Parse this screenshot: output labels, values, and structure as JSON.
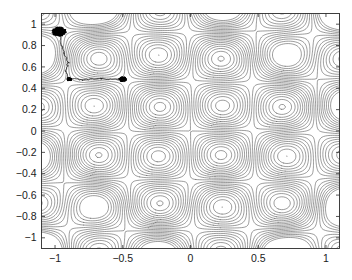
{
  "figure": {
    "title": "",
    "background_color": "#ffffff",
    "contour_color": "#4a4a4a",
    "trace_color": "#000000",
    "axis_color": "#2b2b2b"
  },
  "chart_data": {
    "type": "line",
    "title": "",
    "xlabel": "",
    "ylabel": "",
    "xlim": [
      -1.1,
      1.1
    ],
    "ylim": [
      -1.1,
      1.1
    ],
    "grid": false,
    "legend": null,
    "plot_kind": "contour-with-optimization-trace",
    "xticks": [
      -1,
      -0.5,
      0,
      0.5,
      1
    ],
    "xticklabels": [
      "-1",
      "-0.5",
      "0",
      "0.5",
      "1"
    ],
    "yticks": [
      1,
      0.8,
      0.6,
      0.4,
      0.2,
      0,
      -0.2,
      -0.4,
      -0.6,
      -0.8,
      -1
    ],
    "yticklabels": [
      "1",
      "0.8",
      "0.6",
      "0.4",
      "0.2",
      "0",
      "-0.2",
      "-0.4",
      "-0.6",
      "-0.8",
      "-1"
    ],
    "contour": {
      "description": "Periodic multimodal objective, contour lines of f(x,y)",
      "surface_formula": "sin(6.8x)*sin(6.8y) + 0.55*(x*x + y*y)",
      "n_levels": 24,
      "level_min": -1.0,
      "level_max": 1.3,
      "sample_grid": 170,
      "local_minima_x": [
        -0.92,
        -0.46,
        0.0,
        0.46,
        0.92
      ],
      "local_minima_y": [
        -0.92,
        -0.46,
        0.0,
        0.46,
        0.92
      ]
    },
    "series": [
      {
        "name": "optimization-trace",
        "start_point": [
          -0.97,
          0.93
        ],
        "end_point": [
          -0.5,
          0.48
        ],
        "waypoints": [
          [
            -0.97,
            0.93
          ],
          [
            -0.95,
            0.8
          ],
          [
            -0.93,
            0.72
          ],
          [
            -0.9,
            0.64
          ],
          [
            -0.92,
            0.56
          ],
          [
            -0.9,
            0.49
          ],
          [
            -0.8,
            0.48
          ],
          [
            -0.66,
            0.49
          ],
          [
            -0.55,
            0.48
          ],
          [
            -0.5,
            0.48
          ]
        ],
        "clusters": [
          {
            "center": [
              -0.97,
              0.93
            ],
            "radius": 0.055,
            "n_points": 180
          },
          {
            "center": [
              -0.895,
              0.485
            ],
            "radius": 0.022,
            "n_points": 60
          },
          {
            "center": [
              -0.5,
              0.485
            ],
            "radius": 0.03,
            "n_points": 120
          }
        ]
      }
    ]
  }
}
